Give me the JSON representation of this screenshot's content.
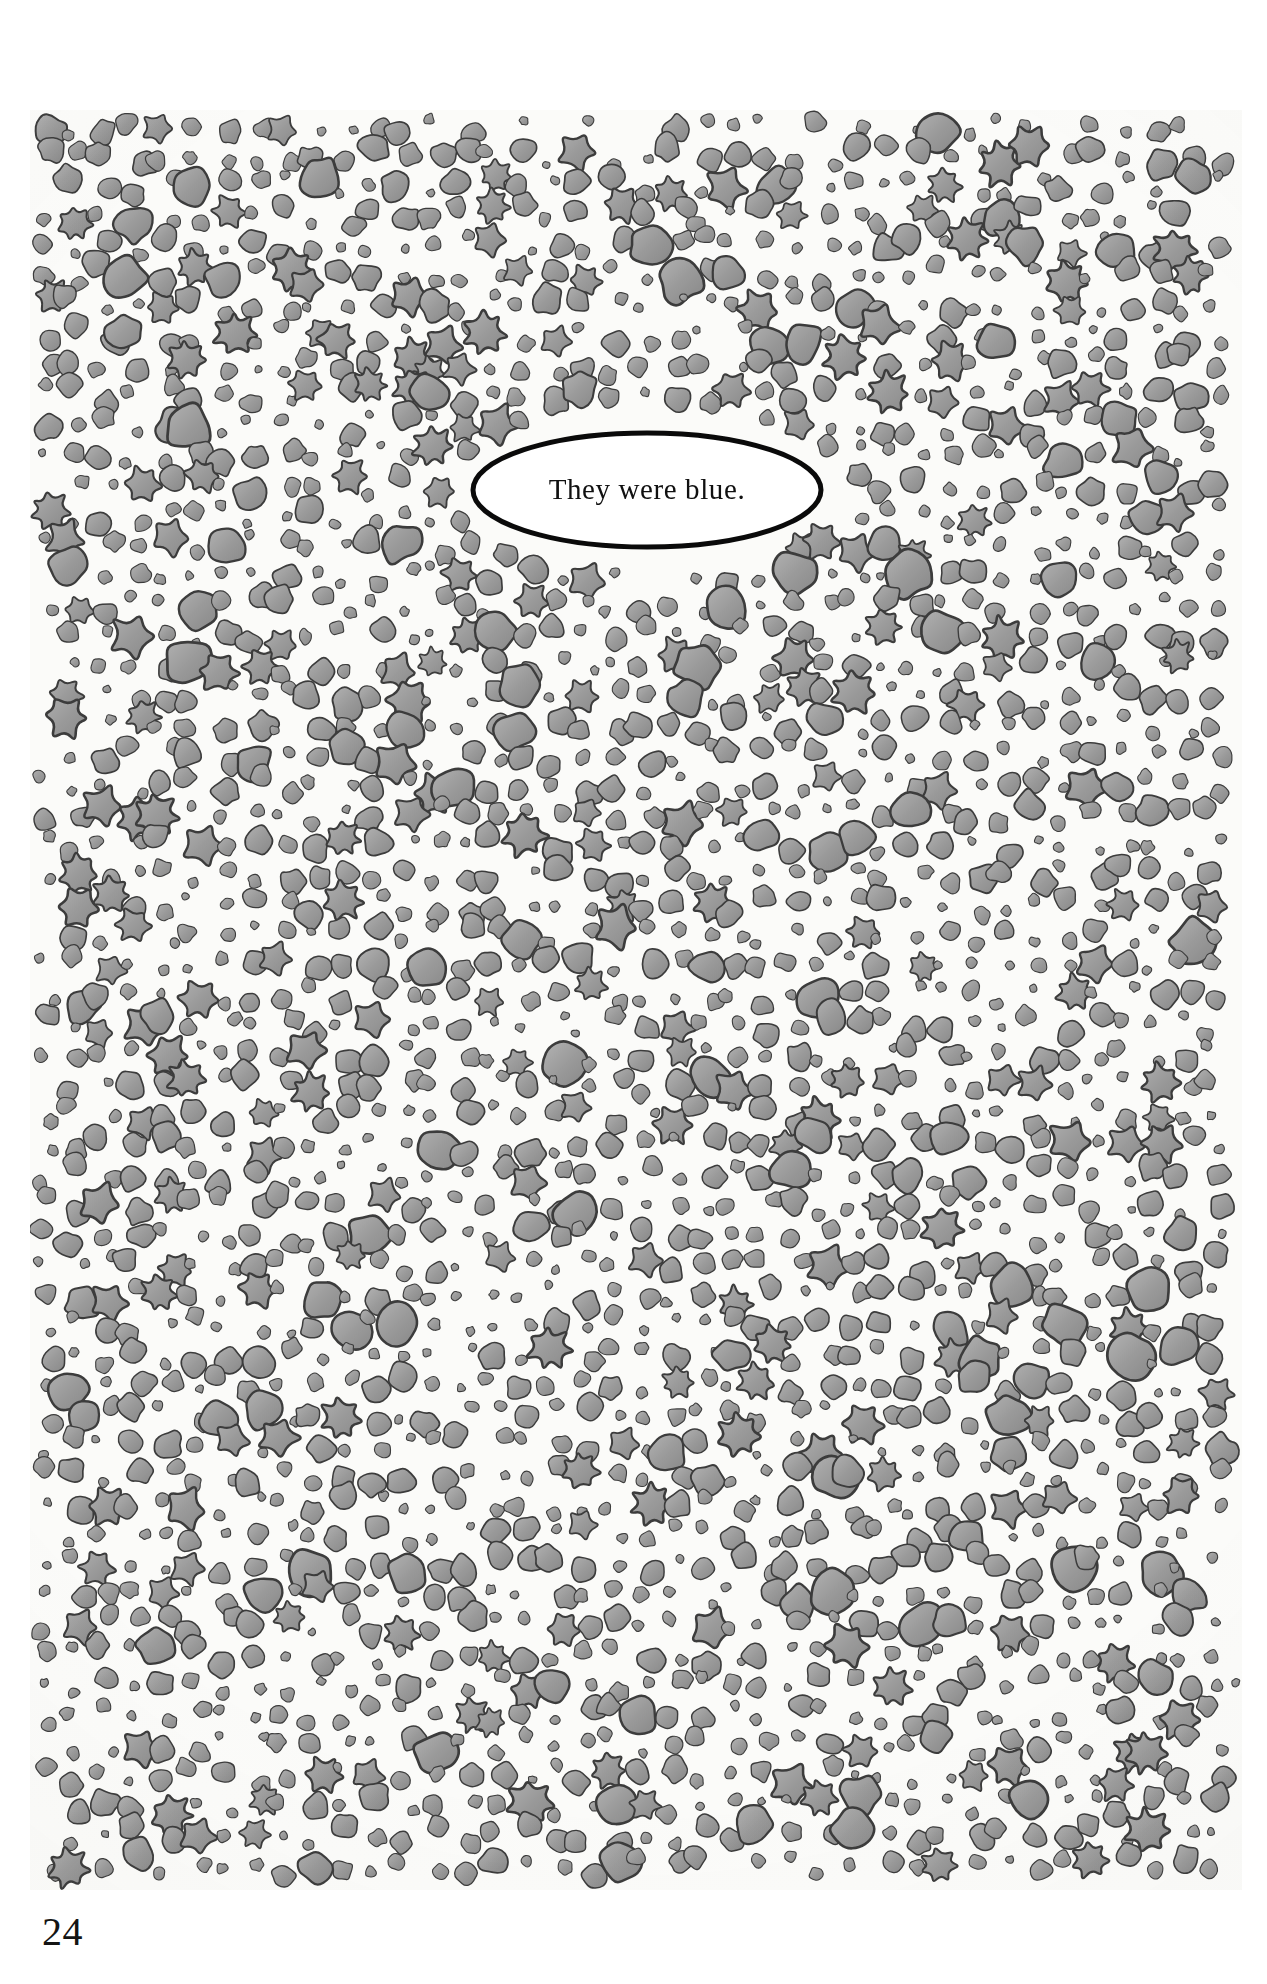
{
  "page": {
    "kind": "illustrated-book-page",
    "folio": "24",
    "paper_color": "#ffffff",
    "plate_color": "#fbfbf9"
  },
  "illustration": {
    "description": "Dense all-over pattern of hand-drawn gray blobs, rounded dots and star-shaped splats covering the page",
    "motif_fill_color": "#9a9a9a",
    "motif_outline_color": "#3c3c3c",
    "background_color": "#fbfbf9",
    "shape_kinds": [
      "round-blob",
      "oval-dot",
      "small-speck",
      "star-splat"
    ]
  },
  "balloon": {
    "text": "They were blue.",
    "shape": "ellipse",
    "fill_color": "#ffffff",
    "outline_color": "#0a0a0a"
  }
}
